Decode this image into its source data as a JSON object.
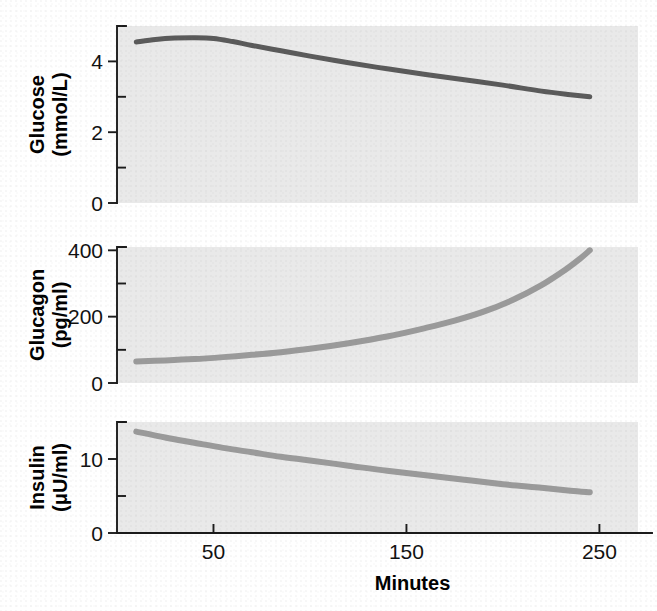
{
  "figure": {
    "background_color": "#ffffff",
    "panel_background_color": "#e9e9e9",
    "axis_color": "#1b1b1b",
    "x_axis_title": "Minutes"
  },
  "chart_data": {
    "type": "line",
    "title": "",
    "subtitle": "",
    "xlabel": "Minutes",
    "grid": false,
    "legend": "none",
    "layout": "3 stacked panels sharing a common x-axis (Minutes)",
    "shared_x": {
      "xlim": [
        0,
        270
      ],
      "ticks": [
        50,
        150,
        250
      ],
      "tick_labels": [
        "50",
        "150",
        "250"
      ],
      "minor_ticks": []
    },
    "panels": [
      {
        "id": "glucose",
        "ylabel": "Glucose\n(mmol/L)",
        "ylabel_line1": "Glucose",
        "ylabel_line2": "(mmol/L)",
        "units": "mmol/L",
        "ylim": [
          0,
          5
        ],
        "yticks": [
          0,
          2,
          4
        ],
        "ytick_labels": [
          "0",
          "2",
          "4"
        ],
        "yminor_ticks": [
          1,
          3,
          5
        ],
        "series_color": "#5a5a5a",
        "line_width": 5,
        "series": [
          {
            "name": "Glucose",
            "x": [
              10,
              20,
              30,
              40,
              50,
              60,
              70,
              85,
              100,
              120,
              140,
              160,
              180,
              200,
              220,
              235,
              245
            ],
            "values": [
              4.55,
              4.62,
              4.66,
              4.67,
              4.65,
              4.56,
              4.45,
              4.3,
              4.15,
              3.96,
              3.79,
              3.63,
              3.48,
              3.33,
              3.16,
              3.06,
              3.0
            ]
          }
        ]
      },
      {
        "id": "glucagon",
        "ylabel": "Glucagon\n(pg/ml)",
        "ylabel_line1": "Glucagon",
        "ylabel_line2": "(pg/ml)",
        "units": "pg/ml",
        "ylim": [
          0,
          410
        ],
        "yticks": [
          0,
          200,
          400
        ],
        "ytick_labels": [
          "0",
          "200",
          "400"
        ],
        "yminor_ticks": [
          100,
          300
        ],
        "series_color": "#9a9a9a",
        "line_width": 6,
        "series": [
          {
            "name": "Glucagon",
            "x": [
              10,
              25,
              40,
              55,
              70,
              85,
              100,
              120,
              140,
              160,
              175,
              190,
              205,
              220,
              232,
              240,
              245
            ],
            "values": [
              65,
              68,
              72,
              78,
              85,
              93,
              103,
              120,
              140,
              166,
              188,
              215,
              250,
              295,
              340,
              375,
              400
            ]
          }
        ]
      },
      {
        "id": "insulin",
        "ylabel": "Insulin\n(μU/ml)",
        "ylabel_line1": "Insulin",
        "ylabel_line2": "(μU/ml)",
        "units": "μU/ml",
        "ylim": [
          0,
          15
        ],
        "yticks": [
          0,
          10
        ],
        "ytick_labels": [
          "0",
          "10"
        ],
        "yminor_ticks": [
          5,
          15
        ],
        "series_color": "#9a9a9a",
        "line_width": 6,
        "series": [
          {
            "name": "Insulin",
            "x": [
              10,
              25,
              40,
              55,
              70,
              85,
              100,
              120,
              140,
              160,
              180,
              200,
              220,
              235,
              245
            ],
            "values": [
              13.7,
              12.9,
              12.2,
              11.5,
              10.9,
              10.3,
              9.8,
              9.1,
              8.4,
              7.8,
              7.2,
              6.6,
              6.1,
              5.7,
              5.5
            ]
          }
        ]
      }
    ]
  }
}
